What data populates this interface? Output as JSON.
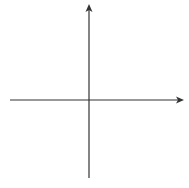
{
  "chart_data": {
    "type": "coordinate-grid",
    "title": "",
    "xlabel": "x",
    "ylabel": "y",
    "xlim": [
      -6,
      6
    ],
    "ylim": [
      -6,
      6
    ],
    "grid": true,
    "x_tick_labels": [
      "-5",
      "-4",
      "-3",
      "-2",
      "-1",
      "1",
      "2",
      "3",
      "4",
      "5"
    ],
    "y_tick_labels": [
      "5",
      "4",
      "3",
      "2",
      "1",
      "-1",
      "-2",
      "-3",
      "-4",
      "-5"
    ],
    "series": []
  },
  "axes": {
    "x_label": "x",
    "y_label": "y"
  },
  "x_ticks": [
    {
      "value": -5,
      "label": "−5"
    },
    {
      "value": -4,
      "label": "−4"
    },
    {
      "value": -3,
      "label": "−3"
    },
    {
      "value": -2,
      "label": "−2"
    },
    {
      "value": -1,
      "label": "−1"
    },
    {
      "value": 1,
      "label": "1"
    },
    {
      "value": 2,
      "label": "2"
    },
    {
      "value": 3,
      "label": "3"
    },
    {
      "value": 4,
      "label": "4"
    },
    {
      "value": 5,
      "label": "5"
    }
  ],
  "y_ticks": [
    {
      "value": 5,
      "label": "5"
    },
    {
      "value": 4,
      "label": "4"
    },
    {
      "value": 3,
      "label": "3"
    },
    {
      "value": 2,
      "label": "2"
    },
    {
      "value": 1,
      "label": "1"
    },
    {
      "value": -1,
      "label": "−1"
    },
    {
      "value": -2,
      "label": "−2"
    },
    {
      "value": -3,
      "label": "−3"
    },
    {
      "value": -4,
      "label": "−4"
    },
    {
      "value": -5,
      "label": "−5"
    }
  ],
  "colors": {
    "grid": "#d9d9d9",
    "axis": "#333333",
    "background": "#ffffff"
  }
}
